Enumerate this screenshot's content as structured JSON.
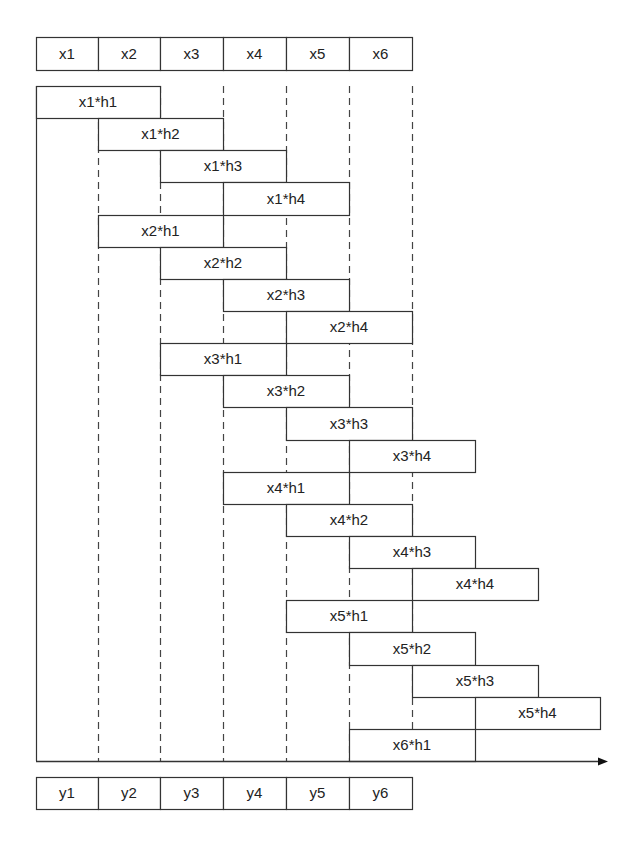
{
  "diagram": {
    "title": "",
    "colors": {
      "stroke": "#333333",
      "fill": "#ffffff",
      "text": "#222222",
      "dash": "#444444"
    },
    "layout": {
      "col_x": [
        36,
        98,
        160,
        223,
        286,
        349,
        412,
        475,
        538,
        600
      ],
      "input_top": 37,
      "input_height": 33,
      "rows_top": 86,
      "row_height": 32.14,
      "axis_y": 761,
      "axis_end_x": 608,
      "output_top": 777,
      "output_height": 32
    },
    "inputs": [
      "x1",
      "x2",
      "x3",
      "x4",
      "x5",
      "x6"
    ],
    "outputs": [
      "y1",
      "y2",
      "y3",
      "y4",
      "y5",
      "y6"
    ],
    "products": [
      {
        "label": "x1*h1",
        "start": 0
      },
      {
        "label": "x1*h2",
        "start": 1
      },
      {
        "label": "x1*h3",
        "start": 2
      },
      {
        "label": "x1*h4",
        "start": 3
      },
      {
        "label": "x2*h1",
        "start": 1
      },
      {
        "label": "x2*h2",
        "start": 2
      },
      {
        "label": "x2*h3",
        "start": 3
      },
      {
        "label": "x2*h4",
        "start": 4
      },
      {
        "label": "x3*h1",
        "start": 2
      },
      {
        "label": "x3*h2",
        "start": 3
      },
      {
        "label": "x3*h3",
        "start": 4
      },
      {
        "label": "x3*h4",
        "start": 5
      },
      {
        "label": "x4*h1",
        "start": 3
      },
      {
        "label": "x4*h2",
        "start": 4
      },
      {
        "label": "x4*h3",
        "start": 5
      },
      {
        "label": "x4*h4",
        "start": 6
      },
      {
        "label": "x5*h1",
        "start": 4
      },
      {
        "label": "x5*h2",
        "start": 5
      },
      {
        "label": "x5*h3",
        "start": 6
      },
      {
        "label": "x5*h4",
        "start": 7
      },
      {
        "label": "x6*h1",
        "start": 5
      }
    ],
    "product_span": 2
  }
}
